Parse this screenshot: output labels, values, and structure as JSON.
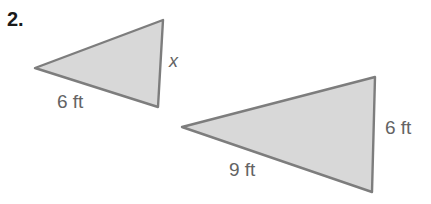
{
  "problem": {
    "number": "2."
  },
  "figure": {
    "style": {
      "fill": "#d8d8d8",
      "stroke": "#7d7d7d",
      "stroke_width": 2.4,
      "background": "#ffffff",
      "label_color": "#636363"
    },
    "triangles": [
      {
        "name": "small-triangle",
        "points": "35,68 163,20 158,107",
        "labels": [
          {
            "name": "side-label-6ft",
            "text": "6 ft"
          },
          {
            "name": "side-label-x",
            "text": "x"
          }
        ]
      },
      {
        "name": "large-triangle",
        "points": "182,127 375,77 372,192",
        "labels": [
          {
            "name": "side-label-9ft",
            "text": "9 ft"
          },
          {
            "name": "side-label-6ft",
            "text": "6 ft"
          }
        ]
      }
    ]
  },
  "labels": {
    "small_triangle_base": "6 ft",
    "small_triangle_unknown": "x",
    "large_triangle_base": "9 ft",
    "large_triangle_right": "6 ft"
  }
}
